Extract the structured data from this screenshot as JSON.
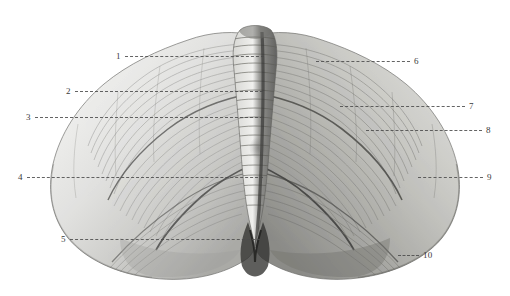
{
  "figure": {
    "kind": "anatomical-illustration",
    "background_color": "#ffffff",
    "ink_color": "#3a3a3a",
    "leader_color": "#4a4a4a",
    "width": 510,
    "height": 296
  },
  "callouts": [
    {
      "number": "1",
      "side": "left",
      "num_x": 116,
      "line_x": 125,
      "line_len": 139,
      "y": 56
    },
    {
      "number": "2",
      "side": "left",
      "num_x": 66,
      "line_x": 75,
      "line_len": 188,
      "y": 91
    },
    {
      "number": "3",
      "side": "left",
      "num_x": 26,
      "line_x": 35,
      "line_len": 228,
      "y": 117
    },
    {
      "number": "4",
      "side": "left",
      "num_x": 18,
      "line_x": 27,
      "line_len": 236,
      "y": 177
    },
    {
      "number": "5",
      "side": "left",
      "num_x": 61,
      "line_x": 70,
      "line_len": 190,
      "y": 239
    },
    {
      "number": "6",
      "side": "right",
      "num_x": 413,
      "line_x": 316,
      "line_len": 94,
      "y": 61
    },
    {
      "number": "7",
      "side": "right",
      "num_x": 468,
      "line_x": 340,
      "line_len": 125,
      "y": 106
    },
    {
      "number": "8",
      "side": "right",
      "num_x": 485,
      "line_x": 366,
      "line_len": 116,
      "y": 130
    },
    {
      "number": "9",
      "side": "right",
      "num_x": 486,
      "line_x": 418,
      "line_len": 65,
      "y": 177
    },
    {
      "number": "10",
      "side": "right",
      "num_x": 422,
      "line_x": 398,
      "line_len": 21,
      "y": 255
    }
  ]
}
